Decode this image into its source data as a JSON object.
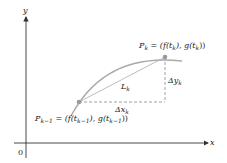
{
  "diagram": {
    "axes": {
      "x_label": "x",
      "y_label": "y",
      "origin_label": "0"
    },
    "points": {
      "p_k": {
        "name": "P",
        "sub": "k",
        "eq": " = (f(t",
        "eq_sub1": "k",
        "eq_mid": "), g(t",
        "eq_sub2": "k",
        "eq_end": "))"
      },
      "p_k_minus_1": {
        "name": "P",
        "sub": "k−1",
        "eq": " = (f(t",
        "eq_sub1": "k−1",
        "eq_mid": "), g(t",
        "eq_sub2": "k−1",
        "eq_end": "))"
      }
    },
    "segment_label": {
      "name": "L",
      "sub": "k"
    },
    "delta_x": {
      "name": "Δx",
      "sub": "k"
    },
    "delta_y": {
      "name": "Δy",
      "sub": "k"
    },
    "colors": {
      "curve": "#b0b0b0",
      "axis": "#333333",
      "point": "#9a9a9a",
      "dashed": "#888888"
    }
  }
}
